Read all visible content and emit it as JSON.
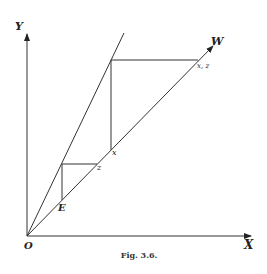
{
  "figure": {
    "caption": "Fig. 3.6.",
    "axes": {
      "origin_label": "O",
      "x_label": "X",
      "y_label": "Y"
    },
    "lines": {
      "steep_ray": "line through origin (steeper)",
      "diagonal_ray_label": "W"
    },
    "points": {
      "upper_corner_label": "x, z",
      "upper_lower_label": "x",
      "lower_corner_label": "z",
      "lower_lower_label": "E"
    }
  }
}
